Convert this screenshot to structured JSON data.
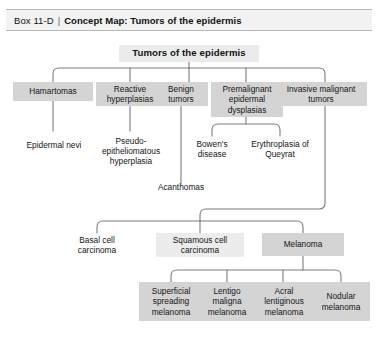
{
  "header": {
    "box_label": "Box 11-D",
    "separator": "|",
    "title": "Concept Map: Tumors of the epidermis"
  },
  "diagram": {
    "type": "concept-map",
    "root": {
      "label": "Tumors of the epidermis"
    },
    "level1": [
      {
        "label": "Hamartomas"
      },
      {
        "label": "Reactive hyperplasias"
      },
      {
        "label": "Benign tumors"
      },
      {
        "label": "Premalignant epidermal dysplasias"
      },
      {
        "label": "Invasive malignant tumors"
      }
    ],
    "level2": [
      {
        "label": "Epidermal nevi"
      },
      {
        "label": "Pseudo-epitheliomatous hyperplasia"
      },
      {
        "label": "Acanthomas"
      },
      {
        "label": "Bowen's disease"
      },
      {
        "label": "Erythroplasia of Queyrat"
      }
    ],
    "level3": [
      {
        "label": "Basal cell carcinoma"
      },
      {
        "label": "Squamous cell carcinoma"
      },
      {
        "label": "Melanoma"
      }
    ],
    "level4": [
      {
        "label": "Superficial spreading melanoma"
      },
      {
        "label": "Lentigo maligna melanoma"
      },
      {
        "label": "Acral lentiginous melanoma"
      },
      {
        "label": "Nodular melanoma"
      }
    ],
    "colors": {
      "box_fill": "#d4d4d4",
      "root_fill": "#ebebeb",
      "connector": "#7d7d7d",
      "header_fill": "#f2f2f2",
      "text": "#141414"
    }
  }
}
